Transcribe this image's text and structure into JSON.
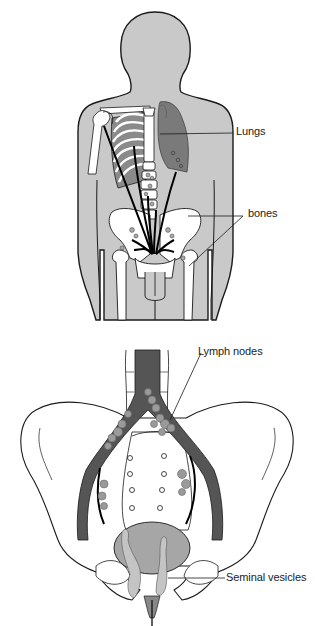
{
  "diagram": {
    "type": "anatomical-illustration",
    "panels": [
      {
        "id": "body-view",
        "description": "Full male torso silhouette (posterior view) with skeleton, showing metastatic spread arrows from pelvis to lungs and bones",
        "labels": [
          {
            "text": "Lungs",
            "target": "left lung (shaded)"
          },
          {
            "text": "bones",
            "target": "pelvis and femur"
          }
        ]
      },
      {
        "id": "pelvis-view",
        "description": "Close-up of pelvis with aorta/iliac vessels, lymph nodes, bladder/prostate and seminal vesicles",
        "labels": [
          {
            "text": "Lymph nodes",
            "target": "clusters along iliac vessels"
          },
          {
            "text": "Seminal vesicles",
            "target": "structures behind bladder"
          }
        ]
      }
    ]
  },
  "labels": {
    "lungs": "Lungs",
    "bones": "bones",
    "lymph_nodes": "Lymph nodes",
    "seminal_vesicles": "Seminal vesicles"
  },
  "colors": {
    "body_fill": "#c9c9c9",
    "lung_fill": "#7a7a7a",
    "vessel_fill": "#555555",
    "node_fill": "#9a9a9a",
    "bladder_fill": "#a6a6a6",
    "vesicle_fill": "#c4c4c4",
    "bone_fill": "#ffffff",
    "outline": "#1a1a1a"
  }
}
